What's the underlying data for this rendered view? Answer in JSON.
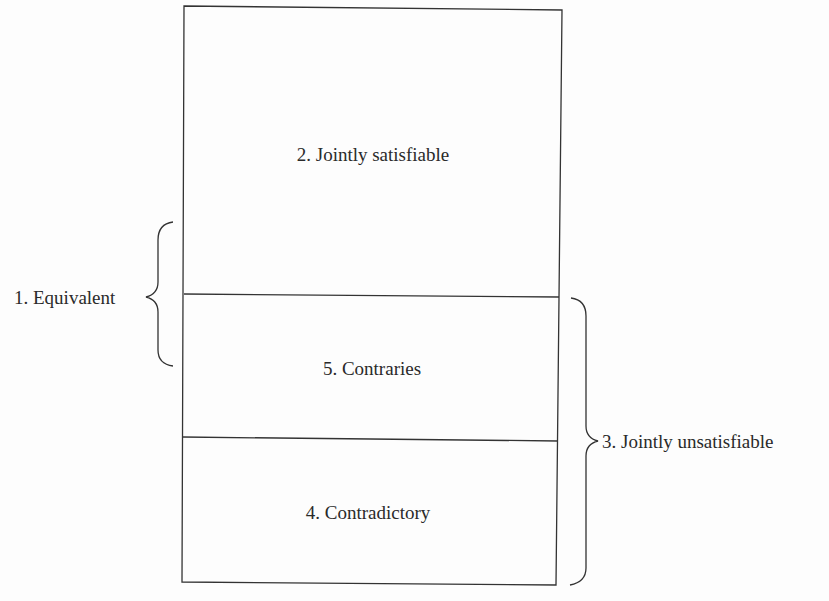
{
  "diagram": {
    "regions": [
      {
        "id": "jointly-satisfiable",
        "label": "2. Jointly satisfiable"
      },
      {
        "id": "contraries",
        "label": "5. Contraries"
      },
      {
        "id": "contradictory",
        "label": "4. Contradictory"
      }
    ],
    "brackets": {
      "left": {
        "label": "1. Equivalent"
      },
      "right": {
        "label": "3. Jointly unsatisfiable"
      }
    },
    "colors": {
      "line": "#333333",
      "text": "#2a2a2a",
      "background": "#fdfdfd"
    }
  }
}
